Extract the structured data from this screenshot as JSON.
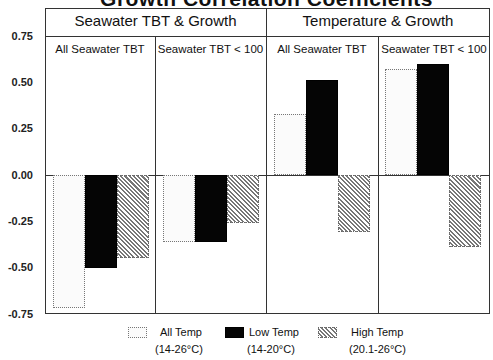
{
  "chart_data": {
    "type": "bar",
    "title": "Growth Correlation Coefficients",
    "xlabel": "",
    "ylabel": "",
    "ylim": [
      -0.75,
      0.75
    ],
    "yticks": [
      "0.75",
      "0.50",
      "0.25",
      "0.00",
      "-0.25",
      "-0.50",
      "-0.75"
    ],
    "groups": [
      {
        "label": "Seawater TBT & Growth",
        "panels": [
          "All Seawater TBT",
          "Seawater TBT < 100"
        ]
      },
      {
        "label": "Temperature & Growth",
        "panels": [
          "All Seawater TBT",
          "Seawater TBT < 100"
        ]
      }
    ],
    "categories": [
      "Seawater TBT & Growth / All Seawater TBT",
      "Seawater TBT & Growth / Seawater TBT < 100",
      "Temperature & Growth / All Seawater TBT",
      "Temperature & Growth / Seawater TBT < 100"
    ],
    "series": [
      {
        "name": "All Temp (14-26°C)",
        "values": [
          -0.72,
          -0.36,
          0.33,
          0.57
        ]
      },
      {
        "name": "Low Temp (14-20°C)",
        "values": [
          -0.5,
          -0.36,
          0.51,
          0.6
        ]
      },
      {
        "name": "High Temp (20.1-26°C)",
        "values": [
          -0.45,
          -0.26,
          -0.31,
          -0.39
        ]
      }
    ],
    "legend_position": "bottom",
    "grid": false
  },
  "ui": {
    "title": "Growth Correlation Coefficients",
    "group1": "Seawater TBT & Growth",
    "group2": "Temperature & Growth",
    "p1": "All Seawater TBT",
    "p2": "Seawater TBT < 100",
    "p3": "All Seawater TBT",
    "p4": "Seawater TBT < 100",
    "ticks": [
      "0.75",
      "0.50",
      "0.25",
      "0.00",
      "-0.25",
      "-0.50",
      "-0.75"
    ],
    "legend": [
      {
        "name": "All Temp",
        "range": "(14-26°C)"
      },
      {
        "name": "Low Temp",
        "range": "(14-20°C)"
      },
      {
        "name": "High Temp",
        "range": "(20.1-26°C)"
      }
    ]
  }
}
